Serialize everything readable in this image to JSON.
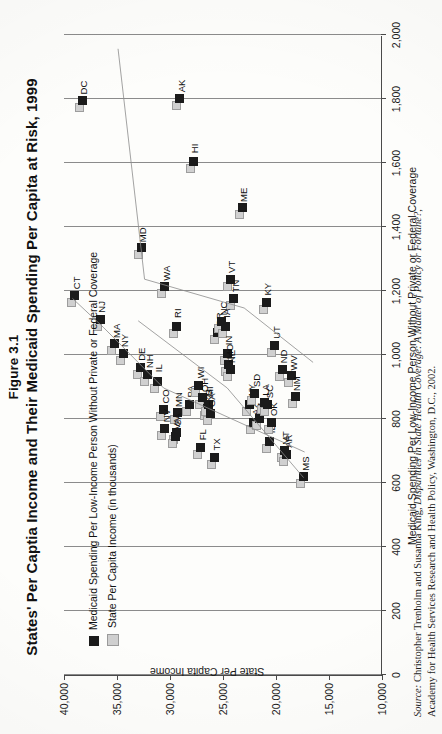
{
  "figure": {
    "number": "Figure 3.1",
    "title": "States' Per Captia Income and Their Medicaid Spending Per Capita at Risk, 1999"
  },
  "legend": {
    "position": "inside-top-left",
    "items": [
      {
        "label": "Medicaid Spending Per Low-Income Person Without Private or Federal Coverage",
        "marker": "dark-square",
        "color": "#1b1b1b"
      },
      {
        "label": "State Per Capita Income (in thousands)",
        "marker": "light-square",
        "color": "#d0d0d0"
      }
    ]
  },
  "source": {
    "label": "Source:",
    "text": "Christopher Trenholm and Susanna King, Disparities in State Health Coverage: A Matter of Policy or Fortune?,",
    "italic_title": "Disparities in State Health Coverage: A Matter of Policy or Fortune?",
    "line2": "Academy for Health Services Research and Health Policy, Washington, D.C., 2002."
  },
  "chart_data": {
    "type": "scatter",
    "title": "States' Per Captia Income and Their Medicaid Spending Per Capita at Risk, 1999",
    "xlabel": "Medicaid Spending Per Low-Income Person Without Private or Federal Coverage",
    "ylabel": "State Per Capita Income",
    "xlim": [
      0,
      2000
    ],
    "ylim": [
      10000,
      40000
    ],
    "xticks": [
      "0",
      "200",
      "400",
      "600",
      "800",
      "1,000",
      "1,200",
      "1,400",
      "1,600",
      "1,800",
      "2,000"
    ],
    "yticks": [
      "10,000",
      "15,000",
      "20,000",
      "25,000",
      "30,000",
      "35,000",
      "40,000"
    ],
    "grid": true,
    "legend_position": "top-left inside plot",
    "series": [
      {
        "name": "Medicaid Spending Per Low-Income Person Without Private or Federal Coverage",
        "marker": "dark-square",
        "color": "#1b1b1b"
      },
      {
        "name": "State Per Capita Income (in thousands)",
        "marker": "light-square",
        "color": "#d0d0d0"
      }
    ],
    "points": [
      {
        "state": "DC",
        "spending": 1795,
        "income": 38300
      },
      {
        "state": "AK",
        "spending": 1800,
        "income": 29100
      },
      {
        "state": "HI",
        "spending": 1605,
        "income": 27800
      },
      {
        "state": "MD",
        "spending": 1335,
        "income": 32700
      },
      {
        "state": "WA",
        "spending": 1215,
        "income": 30500
      },
      {
        "state": "RI",
        "spending": 1090,
        "income": 29400
      },
      {
        "state": "CT",
        "spending": 1185,
        "income": 39000
      },
      {
        "state": "NJ",
        "spending": 1110,
        "income": 36600
      },
      {
        "state": "MA",
        "spending": 1035,
        "income": 35200
      },
      {
        "state": "NY",
        "spending": 1005,
        "income": 34400
      },
      {
        "state": "DE",
        "spending": 962,
        "income": 32800
      },
      {
        "state": "NH",
        "spending": 940,
        "income": 32100
      },
      {
        "state": "IL",
        "spending": 918,
        "income": 31200
      },
      {
        "state": "CO",
        "spending": 830,
        "income": 30600
      },
      {
        "state": "MN",
        "spending": 820,
        "income": 29300
      },
      {
        "state": "NV",
        "spending": 770,
        "income": 30500
      },
      {
        "state": "CA",
        "spending": 757,
        "income": 29400
      },
      {
        "state": "VA",
        "spending": 745,
        "income": 29500
      },
      {
        "state": "PA",
        "spending": 845,
        "income": 28200
      },
      {
        "state": "WI",
        "spending": 905,
        "income": 27300
      },
      {
        "state": "OH",
        "spending": 866,
        "income": 26900
      },
      {
        "state": "KS",
        "spending": 832,
        "income": 26500
      },
      {
        "state": "MI",
        "spending": 845,
        "income": 26400
      },
      {
        "state": "GA",
        "spending": 818,
        "income": 26200
      },
      {
        "state": "FL",
        "spending": 710,
        "income": 27100
      },
      {
        "state": "TX",
        "spending": 680,
        "income": 25800
      },
      {
        "state": "OR",
        "spending": 1070,
        "income": 25500
      },
      {
        "state": "ME",
        "spending": 1460,
        "income": 23200
      },
      {
        "state": "VT",
        "spending": 1235,
        "income": 24300
      },
      {
        "state": "TN",
        "spending": 1175,
        "income": 24000
      },
      {
        "state": "NC",
        "spending": 1105,
        "income": 25100
      },
      {
        "state": "IA",
        "spending": 1090,
        "income": 24800
      },
      {
        "state": "IN",
        "spending": 1005,
        "income": 24600
      },
      {
        "state": "MO",
        "spending": 970,
        "income": 24500
      },
      {
        "state": "NE",
        "spending": 955,
        "income": 24300
      },
      {
        "state": "KY",
        "spending": 1165,
        "income": 20900
      },
      {
        "state": "UT",
        "spending": 1030,
        "income": 20100
      },
      {
        "state": "WY",
        "spending": 845,
        "income": 22500
      },
      {
        "state": "AZ",
        "spending": 790,
        "income": 22100
      },
      {
        "state": "SD",
        "spending": 880,
        "income": 22000
      },
      {
        "state": "AL",
        "spending": 800,
        "income": 21600
      },
      {
        "state": "LA",
        "spending": 850,
        "income": 21100
      },
      {
        "state": "SC",
        "spending": 845,
        "income": 20800
      },
      {
        "state": "ID",
        "spending": 730,
        "income": 20600
      },
      {
        "state": "OK",
        "spending": 790,
        "income": 20400
      },
      {
        "state": "ND",
        "spending": 955,
        "income": 19400
      },
      {
        "state": "MT",
        "spending": 700,
        "income": 19200
      },
      {
        "state": "AR",
        "spending": 690,
        "income": 19000
      },
      {
        "state": "WV",
        "spending": 935,
        "income": 18500
      },
      {
        "state": "NM",
        "spending": 870,
        "income": 18200
      },
      {
        "state": "MS",
        "spending": 620,
        "income": 17400
      }
    ]
  }
}
